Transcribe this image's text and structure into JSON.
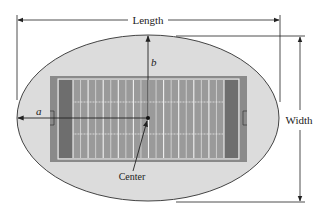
{
  "figure": {
    "labels": {
      "length": "Length",
      "width": "Width",
      "semi_major": "a",
      "semi_minor": "b",
      "center": "Center"
    },
    "colors": {
      "background": "#ffffff",
      "ellipse_fill": "#dcdcdc",
      "ellipse_stroke": "#444444",
      "field_outer": "#8a8a8a",
      "field_inner": "#9a9a9a",
      "end_zone": "#6e6e6e",
      "field_lines": "#f2f2f2",
      "dimension_lines": "#222222"
    },
    "geometry": {
      "ellipse": {
        "cx": 148,
        "cy": 118,
        "rx": 131,
        "ry": 83
      },
      "field_outer": {
        "x": 50,
        "y": 76,
        "w": 197,
        "h": 86
      },
      "field_inner": {
        "x": 58,
        "y": 79,
        "w": 181,
        "h": 80
      },
      "end_zone_width": 15,
      "yard_line_count": 21,
      "hash_rows_y": [
        102,
        134
      ],
      "center_point": {
        "x": 148,
        "y": 118
      }
    }
  }
}
